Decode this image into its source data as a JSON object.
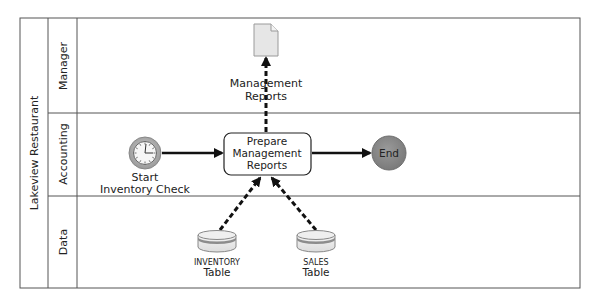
{
  "pool": {
    "title": "Lakeview Restaurant",
    "lanes": [
      {
        "label": "Manager"
      },
      {
        "label": "Accounting"
      },
      {
        "label": "Data"
      }
    ]
  },
  "nodes": {
    "start_event": {
      "type": "timer-start-event",
      "label_line1": "Start",
      "label_line2": "Inventory Check"
    },
    "task": {
      "type": "task",
      "line1": "Prepare",
      "line2": "Management",
      "line3": "Reports"
    },
    "end_event": {
      "type": "end-event",
      "label": "End"
    },
    "document": {
      "type": "data-object",
      "label_line1": "Management",
      "label_line2": "Reports"
    },
    "inventory_store": {
      "type": "data-store",
      "label_smallcaps": "Inventory",
      "label_line2": "Table"
    },
    "sales_store": {
      "type": "data-store",
      "label_smallcaps": "Sales",
      "label_line2": "Table"
    }
  },
  "connections": [
    {
      "from": "start_event",
      "to": "task",
      "style": "solid"
    },
    {
      "from": "task",
      "to": "end_event",
      "style": "solid"
    },
    {
      "from": "task",
      "to": "document",
      "style": "dashed"
    },
    {
      "from": "inventory_store",
      "to": "task",
      "style": "dashed"
    },
    {
      "from": "sales_store",
      "to": "task",
      "style": "dashed"
    }
  ],
  "colors": {
    "border": "#555555",
    "end_fill": "#8a8a8a",
    "timer_ring": "#a8a8a8",
    "doc_fill": "#e6e6e6",
    "store_band": "#8c8c8c"
  }
}
